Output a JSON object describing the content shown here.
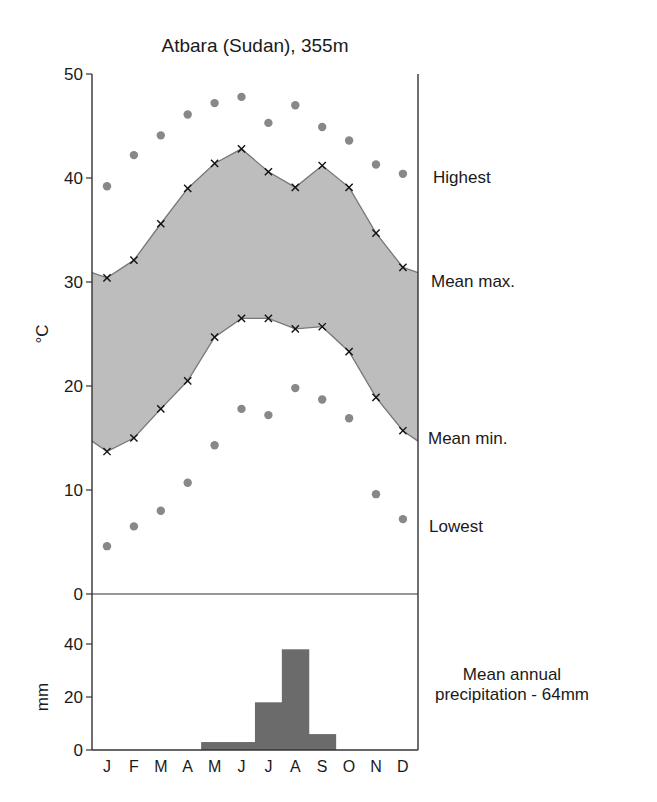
{
  "chart_data": [
    {
      "type": "line",
      "title": "Atbara (Sudan), 355m",
      "xlabel": "",
      "ylabel": "°C",
      "categories": [
        "J",
        "F",
        "M",
        "A",
        "M",
        "J",
        "J",
        "A",
        "S",
        "O",
        "N",
        "D"
      ],
      "ylim": [
        0,
        50
      ],
      "yticks": [
        0,
        10,
        20,
        30,
        40,
        50
      ],
      "grid": false,
      "shaded_band": {
        "between": [
          "Mean max.",
          "Mean min."
        ],
        "color": "#bdbdbd"
      },
      "series": [
        {
          "name": "Highest",
          "marker": "dot",
          "values": [
            39.2,
            42.2,
            44.1,
            46.1,
            47.2,
            47.8,
            45.3,
            47.0,
            44.9,
            43.6,
            41.3,
            40.4
          ]
        },
        {
          "name": "Mean max.",
          "marker": "x",
          "values": [
            30.4,
            32.1,
            35.6,
            39.0,
            41.4,
            42.8,
            40.6,
            39.1,
            41.2,
            39.1,
            34.7,
            31.4
          ]
        },
        {
          "name": "Mean min.",
          "marker": "x",
          "values": [
            13.7,
            15.0,
            17.8,
            20.5,
            24.7,
            26.5,
            26.5,
            25.5,
            25.7,
            23.3,
            18.9,
            15.7
          ]
        },
        {
          "name": "Lowest",
          "marker": "dot",
          "values": [
            4.6,
            6.5,
            8.0,
            10.7,
            14.3,
            17.8,
            17.2,
            19.8,
            18.7,
            16.9,
            9.6,
            7.2
          ]
        }
      ]
    },
    {
      "type": "bar",
      "title": "",
      "xlabel": "",
      "ylabel": "mm",
      "categories": [
        "J",
        "F",
        "M",
        "A",
        "M",
        "J",
        "J",
        "A",
        "S",
        "O",
        "N",
        "D"
      ],
      "values": [
        0,
        0,
        0,
        0,
        3,
        3,
        18,
        38,
        6,
        0,
        0,
        0
      ],
      "ylim": [
        0,
        50
      ],
      "yticks": [
        0,
        20,
        40
      ],
      "annotation": "Mean annual precipitation - 64mm",
      "bar_color": "#6b6b6b"
    }
  ],
  "labels": {
    "title": "Atbara (Sudan), 355m",
    "temp_axis": "°C",
    "precip_axis": "mm",
    "precip_note_line1": "Mean annual",
    "precip_note_line2": "precipitation - 64mm"
  },
  "colors": {
    "band": "#bdbdbd",
    "dot": "#888888",
    "bar": "#6b6b6b",
    "line": "#777777",
    "axis": "#333333"
  }
}
